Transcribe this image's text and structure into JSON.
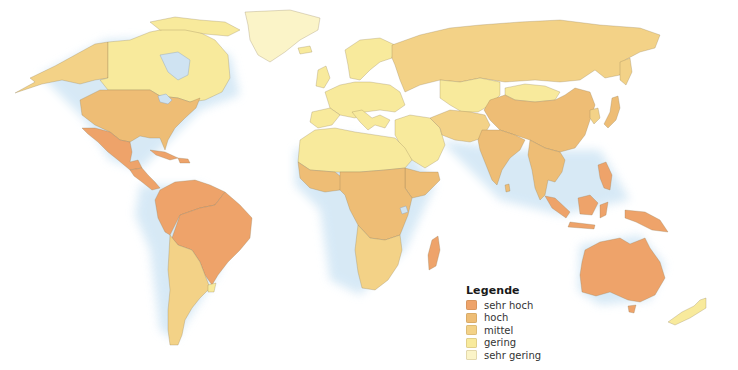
{
  "map": {
    "type": "choropleth-world-map",
    "background": "#ffffff",
    "ocean_glow": "#d6e9f6",
    "lake_color": "#cfe3f2"
  },
  "legend": {
    "title": "Legende",
    "items": [
      {
        "key": "sehr_hoch",
        "label": "sehr hoch",
        "color": "#eea36a"
      },
      {
        "key": "hoch",
        "label": "hoch",
        "color": "#eebd75"
      },
      {
        "key": "mittel",
        "label": "mittel",
        "color": "#f3d287"
      },
      {
        "key": "gering",
        "label": "gering",
        "color": "#f8ea9c"
      },
      {
        "key": "sehr_gering",
        "label": "sehr gering",
        "color": "#fbf4c8"
      }
    ]
  },
  "regions": [
    {
      "name": "Alaska",
      "class": "mittel"
    },
    {
      "name": "Canada",
      "class": "gering"
    },
    {
      "name": "Greenland",
      "class": "sehr_gering"
    },
    {
      "name": "USA",
      "class": "hoch"
    },
    {
      "name": "Mexico",
      "class": "sehr_hoch"
    },
    {
      "name": "Central America",
      "class": "sehr_hoch"
    },
    {
      "name": "Caribbean",
      "class": "sehr_hoch"
    },
    {
      "name": "Brazil",
      "class": "sehr_hoch"
    },
    {
      "name": "Northern South America",
      "class": "sehr_hoch"
    },
    {
      "name": "Argentina / Chile",
      "class": "mittel"
    },
    {
      "name": "Uruguay",
      "class": "gering"
    },
    {
      "name": "Europe",
      "class": "gering"
    },
    {
      "name": "Scandinavia",
      "class": "gering"
    },
    {
      "name": "Russia",
      "class": "mittel"
    },
    {
      "name": "Central Asia",
      "class": "gering"
    },
    {
      "name": "Mongolia",
      "class": "gering"
    },
    {
      "name": "Middle East",
      "class": "gering"
    },
    {
      "name": "Iran / Afghanistan / Pakistan",
      "class": "mittel"
    },
    {
      "name": "North Africa",
      "class": "gering"
    },
    {
      "name": "Sahel",
      "class": "gering"
    },
    {
      "name": "West Africa coast",
      "class": "hoch"
    },
    {
      "name": "Central Africa",
      "class": "hoch"
    },
    {
      "name": "East Africa",
      "class": "hoch"
    },
    {
      "name": "Southern Africa",
      "class": "mittel"
    },
    {
      "name": "Madagascar",
      "class": "sehr_hoch"
    },
    {
      "name": "China",
      "class": "hoch"
    },
    {
      "name": "India",
      "class": "hoch"
    },
    {
      "name": "Southeast Asia",
      "class": "hoch"
    },
    {
      "name": "Japan",
      "class": "hoch"
    },
    {
      "name": "Korea",
      "class": "mittel"
    },
    {
      "name": "Indonesia",
      "class": "sehr_hoch"
    },
    {
      "name": "Philippines",
      "class": "sehr_hoch"
    },
    {
      "name": "Papua New Guinea",
      "class": "sehr_hoch"
    },
    {
      "name": "Australia",
      "class": "sehr_hoch"
    },
    {
      "name": "New Zealand",
      "class": "gering"
    }
  ]
}
